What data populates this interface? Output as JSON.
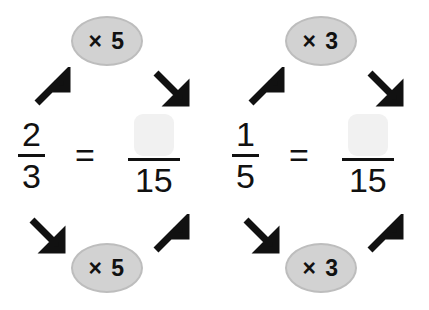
{
  "page": {
    "background_color": "#ffffff",
    "ink_color": "#111111",
    "pill_fill": "#d2d2d2",
    "pill_border": "#bdbdbd",
    "blank_fill": "#f1f1f1"
  },
  "groups": [
    {
      "id": "equivalent-fraction-1",
      "top_label": "× 5",
      "bottom_label": "× 5",
      "left_fraction": {
        "numerator": "2",
        "denominator": "3"
      },
      "equals": "=",
      "right_fraction": {
        "numerator": "",
        "denominator": "15"
      },
      "arrows": [
        {
          "name": "arrow-top-left",
          "direction": "up-right"
        },
        {
          "name": "arrow-top-right",
          "direction": "down-right"
        },
        {
          "name": "arrow-bottom-left",
          "direction": "down-right"
        },
        {
          "name": "arrow-bottom-right",
          "direction": "up-right"
        }
      ]
    },
    {
      "id": "equivalent-fraction-2",
      "top_label": "× 3",
      "bottom_label": "× 3",
      "left_fraction": {
        "numerator": "1",
        "denominator": "5"
      },
      "equals": "=",
      "right_fraction": {
        "numerator": "",
        "denominator": "15"
      },
      "arrows": [
        {
          "name": "arrow-top-left",
          "direction": "up-right"
        },
        {
          "name": "arrow-top-right",
          "direction": "down-right"
        },
        {
          "name": "arrow-bottom-left",
          "direction": "down-right"
        },
        {
          "name": "arrow-bottom-right",
          "direction": "up-right"
        }
      ]
    }
  ]
}
